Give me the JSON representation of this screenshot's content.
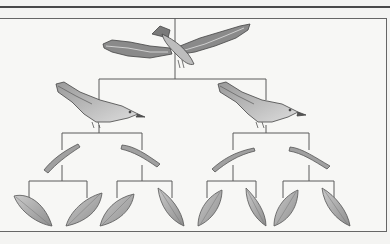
{
  "diagram": {
    "type": "food-chain-tree",
    "colors": {
      "line": "#5a5a5a",
      "organism_fill": "#a9a9a9",
      "organism_dark": "#6e6e6e",
      "organism_light": "#d4d4d4",
      "background": "#f7f7f5"
    },
    "levels": [
      {
        "name": "apex-predator",
        "organism": "eagle",
        "count": 1
      },
      {
        "name": "secondary-consumer",
        "organism": "songbird",
        "count": 2
      },
      {
        "name": "primary-consumer",
        "organism": "caterpillar",
        "count": 4
      },
      {
        "name": "producer",
        "organism": "leaf",
        "count": 8
      }
    ]
  }
}
